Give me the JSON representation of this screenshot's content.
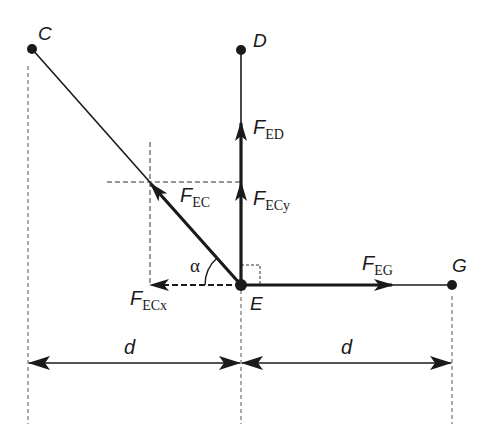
{
  "figure": {
    "points": {
      "C": {
        "label": "C",
        "x": 32,
        "y": 49
      },
      "D": {
        "label": "D",
        "x": 241,
        "y": 50
      },
      "E": {
        "label": "E",
        "x": 241,
        "y": 285
      },
      "G": {
        "label": "G",
        "x": 452,
        "y": 285
      }
    },
    "forces": {
      "F_ED": {
        "main": "F",
        "sub": "ED"
      },
      "F_EC": {
        "main": "F",
        "sub": "EC"
      },
      "F_ECy": {
        "main": "F",
        "sub": "ECy"
      },
      "F_ECx": {
        "main": "F",
        "sub": "ECx"
      },
      "F_EG": {
        "main": "F",
        "sub": "EG"
      }
    },
    "angle": {
      "label": "α"
    },
    "dimensions": {
      "left": {
        "label": "d"
      },
      "right": {
        "label": "d"
      }
    },
    "colors": {
      "ink": "#1a1a1a",
      "background": "#ffffff"
    }
  }
}
